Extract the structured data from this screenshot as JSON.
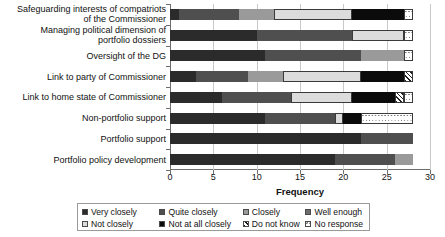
{
  "chart_data": {
    "type": "bar",
    "orientation": "horizontal",
    "stacked": true,
    "title": "",
    "xlabel": "Frequency",
    "ylabel": "",
    "xlim": [
      0,
      30
    ],
    "xticks": [
      0,
      5,
      10,
      15,
      20,
      25,
      30
    ],
    "grid": true,
    "legend_position": "bottom",
    "categories": [
      "Safeguarding interests of compatriots of the Commissioner",
      "Managing political dimension of portfolio dossiers",
      "Oversight of the DG",
      "Link to party of Commissioner",
      "Link to home state of Commissioner",
      "Non-portfolio support",
      "Portfolio support",
      "Portfolio policy development"
    ],
    "category_labels_wrapped": [
      "Safeguarding interests of compatriots\nof the Commissioner",
      "Managing political dimension of\nportfolio dossiers",
      "Oversight of the DG",
      "Link to party of Commissioner",
      "Link to home state of Commissioner",
      "Non-portfolio support",
      "Portfolio support",
      "Portfolio policy development"
    ],
    "series": [
      {
        "name": "Very closely",
        "color": "#2b2b2b",
        "values": [
          1,
          10,
          11,
          3,
          6,
          11,
          22,
          19
        ]
      },
      {
        "name": "Quite closely",
        "color": "#4f4f4f",
        "values": [
          7,
          11,
          11,
          6,
          8,
          8,
          6,
          7
        ]
      },
      {
        "name": "Closely",
        "color": "#9a9a9a",
        "values": [
          4,
          0,
          5,
          4,
          0,
          0,
          0,
          2
        ]
      },
      {
        "name": "Well enough",
        "color": "#6d6d6d",
        "values": [
          0,
          0,
          0,
          0,
          0,
          0,
          0,
          0
        ]
      },
      {
        "name": "Not closely",
        "color": "#dcdcdc",
        "values": [
          9,
          6,
          0,
          9,
          7,
          1,
          0,
          0
        ]
      },
      {
        "name": "Not at all closely",
        "color": "#0b0b0b",
        "values": [
          6,
          0,
          0,
          5,
          5,
          2,
          0,
          0
        ]
      },
      {
        "name": "Do not know",
        "color": "#1f1f1f",
        "values": [
          0,
          0,
          0,
          1,
          1,
          0,
          0,
          0
        ]
      },
      {
        "name": "No response",
        "color": "#ffffff",
        "values": [
          1,
          1,
          1,
          0,
          1,
          6,
          0,
          0
        ]
      }
    ],
    "totals": [
      28,
      28,
      28,
      28,
      28,
      28,
      28,
      28
    ]
  },
  "axis": {
    "xlabel": "Frequency",
    "ticks": [
      "0",
      "5",
      "10",
      "15",
      "20",
      "25",
      "30"
    ]
  },
  "legend": {
    "row1": [
      {
        "label": "Very closely",
        "fill": "f-very-closely"
      },
      {
        "label": "Quite closely",
        "fill": "f-quite-closely"
      },
      {
        "label": "Closely",
        "fill": "f-closely"
      },
      {
        "label": "Well enough",
        "fill": "f-well-enough"
      }
    ],
    "row2": [
      {
        "label": "Not closely",
        "fill": "f-not-closely"
      },
      {
        "label": "Not at all closely",
        "fill": "f-not-at-all"
      },
      {
        "label": "Do not know",
        "fill": "f-do-not-know"
      },
      {
        "label": "No response",
        "fill": "f-no-response"
      }
    ]
  }
}
